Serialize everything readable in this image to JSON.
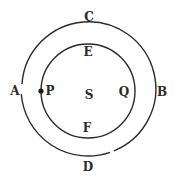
{
  "diagram": {
    "type": "concentric-circles",
    "outer_circle": {
      "cx": 88,
      "cy": 89,
      "r": 67,
      "stroke": "#2a2a2a"
    },
    "inner_circle": {
      "cx": 88,
      "cy": 91,
      "r": 47,
      "stroke": "#2a2a2a"
    },
    "point_p": {
      "cx": 41,
      "cy": 91,
      "r": 2.5,
      "fill": "#1a1a1a"
    },
    "labels": {
      "A": "A",
      "B": "B",
      "C": "C",
      "D": "D",
      "E": "E",
      "F": "F",
      "P": "P",
      "Q": "Q",
      "S": "S"
    }
  }
}
